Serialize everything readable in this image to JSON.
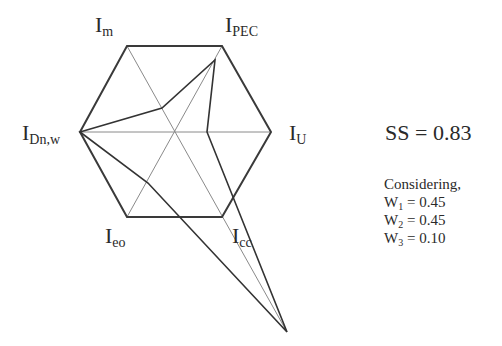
{
  "diagram": {
    "type": "hexagonal radar (six-axis index diagram)",
    "axes": [
      {
        "id": "I_m",
        "base": "I",
        "sub": "m"
      },
      {
        "id": "I_PEC",
        "base": "I",
        "sub": "PEC"
      },
      {
        "id": "I_U",
        "base": "I",
        "sub": "U"
      },
      {
        "id": "I_cc",
        "base": "I",
        "sub": "cc"
      },
      {
        "id": "I_eo",
        "base": "I",
        "sub": "eo"
      },
      {
        "id": "I_Dn,w",
        "base": "I",
        "sub": "Dn,w"
      }
    ],
    "hexagon_vertices": {
      "I_m": [
        127,
        46
      ],
      "I_PEC": [
        222,
        46
      ],
      "I_U": [
        271,
        132
      ],
      "I_cc": [
        222,
        217
      ],
      "I_eo": [
        127,
        217
      ],
      "I_Dn,w": [
        80,
        132
      ]
    },
    "center": [
      176,
      132
    ],
    "data_polygon": [
      [
        80,
        132
      ],
      [
        162,
        108
      ],
      [
        215,
        60
      ],
      [
        207,
        132
      ],
      [
        287,
        332
      ],
      [
        148,
        183
      ]
    ],
    "axis_extension_tip": [
      287,
      332
    ],
    "colors": {
      "outline": "#3a3a3a",
      "axis": "#8a8a8a",
      "polygon": "#333333"
    }
  },
  "result": {
    "label": "SS = 0.83"
  },
  "considering": {
    "title": "Considering,",
    "weights": [
      {
        "base": "W",
        "sub": "1",
        "value": " = 0.45"
      },
      {
        "base": "W",
        "sub": "2",
        "value": " = 0.45"
      },
      {
        "base": "W",
        "sub": "3",
        "value": " = 0.10"
      }
    ]
  }
}
